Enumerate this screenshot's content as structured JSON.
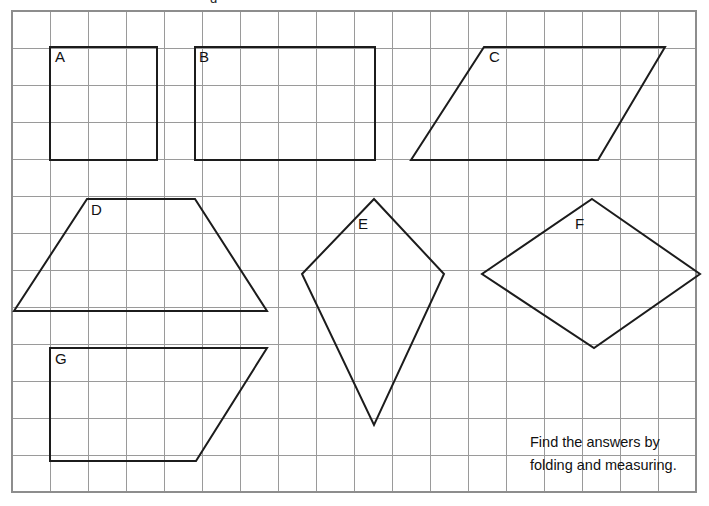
{
  "worksheet": {
    "title": "Shape folding and measuring worksheet",
    "background_color": "#ffffff",
    "grid": {
      "line_color": "#9a9a9a",
      "border_color": "#8d8d8d",
      "cell_size": 38,
      "origin_x": 12,
      "origin_y": 11,
      "columns": 18,
      "rows": 13,
      "width": 684,
      "height": 481
    },
    "shape_stroke_color": "#1c1c1c",
    "label_color": "#111111",
    "cropped_top_text": "g",
    "shapes": [
      {
        "id": "shape-a",
        "label": "A",
        "kind": "square",
        "label_x": 55,
        "label_y": 51,
        "points": "50,47 157,47 157,160 50,160"
      },
      {
        "id": "shape-b",
        "label": "B",
        "kind": "rectangle",
        "label_x": 199,
        "label_y": 51,
        "points": "195,47 375,47 375,160 195,160"
      },
      {
        "id": "shape-c",
        "label": "C",
        "kind": "parallelogram",
        "label_x": 489,
        "label_y": 51,
        "points": "484,47 665,47 598,160 411,160"
      },
      {
        "id": "shape-d",
        "label": "D",
        "kind": "trapezium",
        "label_x": 91,
        "label_y": 204,
        "points": "87,199 195,199 267,311 14,311"
      },
      {
        "id": "shape-e",
        "label": "E",
        "kind": "kite",
        "label_x": 358,
        "label_y": 218,
        "points": "374,199 444,274 374,425 302,274"
      },
      {
        "id": "shape-f",
        "label": "F",
        "kind": "rhombus",
        "label_x": 575,
        "label_y": 218,
        "points": "592,199 700,274 594,348 482,274"
      },
      {
        "id": "shape-g",
        "label": "G",
        "kind": "trapezium",
        "label_x": 55,
        "label_y": 353,
        "points": "50,348 267,348 196,461 50,461"
      }
    ],
    "instruction": {
      "line1": "Find the answers by",
      "line2": "folding and measuring.",
      "x": 530,
      "line1_y": 447,
      "line2_y": 470
    }
  }
}
